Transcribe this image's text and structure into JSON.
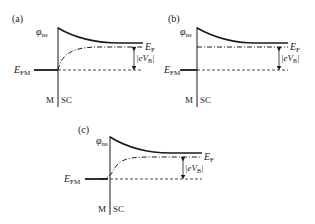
{
  "panels": [
    {
      "id": "a",
      "label": "(a)",
      "phi": "φ",
      "phi_sub": "ns",
      "ef": "E",
      "ef_sub": "F",
      "efm": "E",
      "efm_sub": "FM",
      "evb": "|eV",
      "evb_sub": "B",
      "evb_end": "|",
      "m": "M",
      "sc": "SC"
    },
    {
      "id": "b",
      "label": "(b)",
      "phi": "φ",
      "phi_sub": "ns",
      "ef": "E",
      "ef_sub": "F",
      "efm": "E",
      "efm_sub": "FM",
      "evb": "|eV",
      "evb_sub": "B",
      "evb_end": "|",
      "m": "M",
      "sc": "SC"
    },
    {
      "id": "c",
      "label": "(c)",
      "phi": "φ",
      "phi_sub": "ns",
      "ef": "E",
      "ef_sub": "F",
      "efm": "E",
      "efm_sub": "FM",
      "evb": "|eV",
      "evb_sub": "B",
      "evb_end": "|",
      "m": "M",
      "sc": "SC"
    }
  ],
  "colors": {
    "line": "#1a1a1a",
    "background": "#ffffff"
  }
}
